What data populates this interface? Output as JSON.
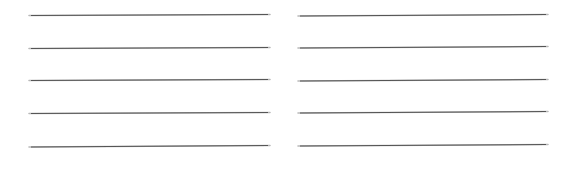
{
  "page": {
    "width_px": 568,
    "height_px": 187,
    "background_color": "#ffffff",
    "visible_text": "",
    "has_text_content": false
  },
  "rules": {
    "line_color": "#555555",
    "line_halo_color": "#b9b9b9",
    "line_thickness_px": 1,
    "line_count_total": 10,
    "lines_per_column": 5,
    "column_count": 2,
    "row_spacing_px": 32.6,
    "slope_note": "each rule sits about 1 px higher at its right end than at its left end"
  },
  "columns": [
    {
      "name": "left-column",
      "x_start_px": 29,
      "x_end_px": 270,
      "length_px": 241,
      "lines": [
        {
          "index": 1,
          "y_left_px": 15.5,
          "y_right_px": 14.5
        },
        {
          "index": 2,
          "y_left_px": 48.0,
          "y_right_px": 47.0
        },
        {
          "index": 3,
          "y_left_px": 80.5,
          "y_right_px": 79.5
        },
        {
          "index": 4,
          "y_left_px": 113.0,
          "y_right_px": 112.0
        },
        {
          "index": 5,
          "y_left_px": 146.5,
          "y_right_px": 145.0
        }
      ]
    },
    {
      "name": "right-column",
      "x_start_px": 14,
      "x_end_px": 264,
      "length_px": 250,
      "lines": [
        {
          "index": 1,
          "y_left_px": 15.5,
          "y_right_px": 14.0
        },
        {
          "index": 2,
          "y_left_px": 48.0,
          "y_right_px": 46.5
        },
        {
          "index": 3,
          "y_left_px": 80.5,
          "y_right_px": 79.0
        },
        {
          "index": 4,
          "y_left_px": 113.0,
          "y_right_px": 111.5
        },
        {
          "index": 5,
          "y_left_px": 146.0,
          "y_right_px": 144.5
        }
      ]
    }
  ]
}
